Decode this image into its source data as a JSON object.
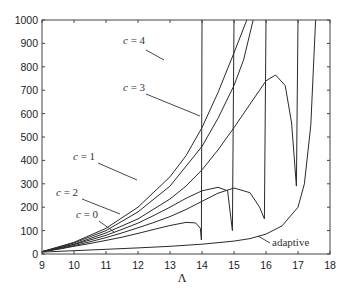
{
  "chart_data": {
    "type": "line",
    "title": "",
    "xlabel": "Λ",
    "ylabel": "",
    "xlim": [
      9,
      18
    ],
    "ylim": [
      0,
      1000
    ],
    "grid": false,
    "legend": "none (inline annotations)",
    "xticks": [
      9,
      10,
      11,
      12,
      13,
      14,
      15,
      16,
      17,
      18
    ],
    "yticks": [
      0,
      100,
      200,
      300,
      400,
      500,
      600,
      700,
      800,
      900,
      1000
    ],
    "series": [
      {
        "name": "c = 0",
        "x": [
          9,
          9.5,
          10,
          10.5,
          11,
          11.5,
          12,
          12.5,
          13,
          13.5,
          13.8,
          13.95,
          13.98,
          14.0
        ],
        "y": [
          10,
          20,
          33,
          45,
          58,
          72,
          88,
          105,
          122,
          135,
          133,
          110,
          60,
          1000
        ]
      },
      {
        "name": "c = 1",
        "x": [
          9,
          9.5,
          10,
          10.5,
          11,
          11.5,
          12,
          12.5,
          13,
          13.5,
          14,
          14.5,
          14.8,
          14.95,
          15.0
        ],
        "y": [
          10,
          25,
          40,
          60,
          80,
          105,
          132,
          165,
          200,
          238,
          270,
          285,
          270,
          100,
          1000
        ]
      },
      {
        "name": "c = 2",
        "x": [
          9,
          9.5,
          10,
          10.5,
          11,
          11.5,
          12,
          12.5,
          13,
          13.5,
          14,
          14.5,
          15,
          15.5,
          15.8,
          15.95,
          16.0
        ],
        "y": [
          10,
          22,
          36,
          52,
          70,
          90,
          112,
          135,
          160,
          190,
          225,
          260,
          282,
          262,
          200,
          150,
          1000
        ]
      },
      {
        "name": "c = 3",
        "x": [
          9,
          10,
          11,
          12,
          13,
          13.5,
          14,
          14.5,
          15,
          15.5,
          16,
          16.3,
          16.6,
          16.8,
          16.95,
          17.0
        ],
        "y": [
          10,
          42,
          90,
          150,
          235,
          290,
          360,
          445,
          540,
          640,
          740,
          765,
          720,
          560,
          290,
          1000
        ]
      },
      {
        "name": "c = 4",
        "x": [
          9,
          10,
          11,
          12,
          13,
          13.5,
          14,
          14.5,
          15,
          15.4
        ],
        "y": [
          10,
          50,
          110,
          200,
          330,
          420,
          540,
          690,
          860,
          1000
        ]
      },
      {
        "name": "unlabeled steep curve",
        "x": [
          9,
          10,
          11,
          12,
          13,
          14,
          14.5,
          15,
          15.3,
          15.6
        ],
        "y": [
          10,
          47,
          100,
          180,
          290,
          460,
          580,
          720,
          830,
          1000
        ]
      },
      {
        "name": "adaptive",
        "x": [
          9,
          10,
          11,
          12,
          13,
          14,
          15,
          15.5,
          16,
          16.5,
          17,
          17.2,
          17.4,
          17.55
        ],
        "y": [
          8,
          14,
          20,
          26,
          33,
          42,
          55,
          66,
          85,
          120,
          200,
          300,
          550,
          1000
        ]
      }
    ],
    "annotations": [
      {
        "text": "c = 4",
        "at": [
          12.9,
          915
        ],
        "points_to": [
          13.95,
          855
        ]
      },
      {
        "text": "c = 3",
        "at": [
          12.9,
          715
        ],
        "points_to": [
          15.0,
          580
        ]
      },
      {
        "text": "c = 1",
        "at": [
          11.3,
          395
        ],
        "points_to": [
          13.9,
          310
        ]
      },
      {
        "text": "c = 2",
        "at": [
          10.4,
          250
        ],
        "points_to": [
          13.6,
          175
        ]
      },
      {
        "text": "c = 0",
        "at": [
          9.5,
          130
        ],
        "points_to": [
          10.9,
          70
        ]
      },
      {
        "text": "adaptive",
        "at": [
          16.0,
          30
        ],
        "points_to": [
          15.4,
          62
        ]
      }
    ]
  },
  "axes": {
    "x_title": "Λ",
    "x_tick_labels": [
      "9",
      "10",
      "11",
      "12",
      "13",
      "14",
      "15",
      "16",
      "17",
      "18"
    ],
    "y_tick_labels": [
      "0",
      "100",
      "200",
      "300",
      "400",
      "500",
      "600",
      "700",
      "800",
      "900",
      "1000"
    ]
  },
  "labels": {
    "c4": "c = 4",
    "c3": "c = 3",
    "c1": "c = 1",
    "c2": "c = 2",
    "c0": "c = 0",
    "adaptive": "adaptive"
  }
}
